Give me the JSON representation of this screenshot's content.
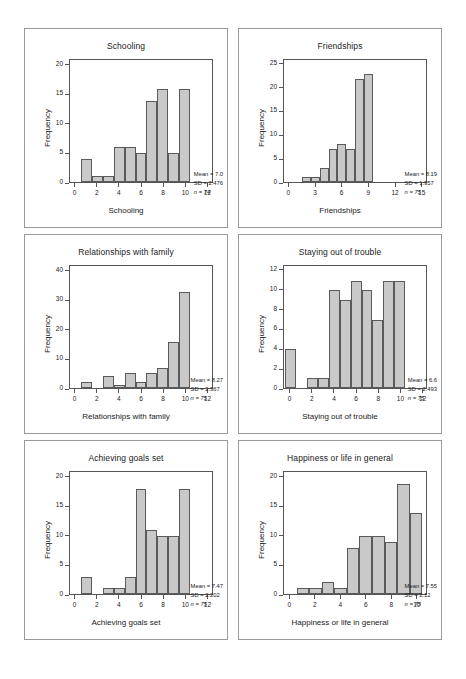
{
  "page": {
    "background": "#ffffff",
    "bar_fill": "#c9c9c9",
    "bar_stroke": "#5a5a5a",
    "axis_color": "#555555",
    "panel_border": "#9a9a9a"
  },
  "charts": [
    {
      "id": "schooling",
      "chart_data": {
        "type": "bar",
        "title": "Schooling",
        "xlabel": "Schooling",
        "ylabel": "Frequency",
        "categories": [
          1,
          2,
          3,
          4,
          5,
          6,
          7,
          8,
          9,
          10
        ],
        "values": [
          4,
          1,
          1,
          6,
          6,
          5,
          14,
          16,
          5,
          16
        ],
        "xticks": [
          0,
          2,
          4,
          6,
          8,
          10,
          12
        ],
        "yticks": [
          0,
          5,
          10,
          15,
          20
        ],
        "xlim": [
          -0.5,
          12.5
        ],
        "ylim": [
          0,
          21
        ],
        "grid": false,
        "legend": "none"
      },
      "stats": {
        "mean": "Mean = 7.0",
        "sd": "SD = 2.476",
        "n": "n = 74"
      }
    },
    {
      "id": "friendships",
      "chart_data": {
        "type": "bar",
        "title": "Friendships",
        "xlabel": "Friendships",
        "ylabel": "Frequency",
        "categories": [
          2,
          3,
          4,
          5,
          6,
          7,
          8,
          9,
          10
        ],
        "values": [
          1,
          1,
          3,
          7,
          8,
          7,
          22,
          23,
          0
        ],
        "xticks": [
          0,
          3,
          6,
          9,
          12,
          15
        ],
        "yticks": [
          0,
          5,
          10,
          15,
          20,
          25
        ],
        "xlim": [
          -0.6,
          15.6
        ],
        "ylim": [
          0,
          26
        ],
        "grid": false,
        "legend": "none"
      },
      "stats": {
        "mean": "Mean = 8.19",
        "sd": "SD = 1.957",
        "n": "n = 75"
      }
    },
    {
      "id": "relationships-with-family",
      "chart_data": {
        "type": "bar",
        "title": "Relationships with family",
        "xlabel": "Relationships with family",
        "ylabel": "Frequency",
        "categories": [
          1,
          2,
          3,
          4,
          5,
          6,
          7,
          8,
          9,
          10
        ],
        "values": [
          2,
          0,
          4,
          1,
          5,
          2,
          5,
          7,
          16,
          33
        ],
        "xticks": [
          0,
          2,
          4,
          6,
          8,
          10,
          12
        ],
        "yticks": [
          0,
          10,
          20,
          30,
          40
        ],
        "xlim": [
          -0.5,
          12.5
        ],
        "ylim": [
          0,
          42
        ],
        "grid": false,
        "legend": "none"
      },
      "stats": {
        "mean": "Mean = 8.27",
        "sd": "SD = 2.367",
        "n": "n = 75"
      }
    },
    {
      "id": "staying-out-of-trouble",
      "chart_data": {
        "type": "bar",
        "title": "Staying out of trouble",
        "xlabel": "Staying out of trouble",
        "ylabel": "Frequency",
        "categories": [
          0,
          1,
          2,
          3,
          4,
          5,
          6,
          7,
          8,
          9,
          10
        ],
        "values": [
          4,
          0,
          1,
          1,
          10,
          9,
          11,
          10,
          7,
          11,
          11
        ],
        "xticks": [
          0,
          2,
          4,
          6,
          8,
          10,
          12
        ],
        "yticks": [
          0,
          2,
          4,
          6,
          8,
          10,
          12
        ],
        "xlim": [
          -0.6,
          12.4
        ],
        "ylim": [
          0,
          12.5
        ],
        "grid": false,
        "legend": "none"
      },
      "stats": {
        "mean": "Mean = 6.6",
        "sd": "SD = 2.493",
        "n": "n = 75"
      }
    },
    {
      "id": "achieving-goals-set",
      "chart_data": {
        "type": "bar",
        "title": "Achieving goals set",
        "xlabel": "Achieving goals set",
        "ylabel": "Frequency",
        "categories": [
          1,
          2,
          3,
          4,
          5,
          6,
          7,
          8,
          9,
          10
        ],
        "values": [
          3,
          0,
          1,
          1,
          3,
          18,
          11,
          10,
          10,
          18
        ],
        "xticks": [
          0,
          2,
          4,
          6,
          8,
          10,
          12
        ],
        "yticks": [
          0,
          5,
          10,
          15,
          20
        ],
        "xlim": [
          -0.5,
          12.5
        ],
        "ylim": [
          0,
          21
        ],
        "grid": false,
        "legend": "none"
      },
      "stats": {
        "mean": "Mean = 7.47",
        "sd": "SD = 2.202",
        "n": "n = 75"
      }
    },
    {
      "id": "happiness-or-life-in-general",
      "chart_data": {
        "type": "bar",
        "title": "Happiness or life in general",
        "xlabel": "Happiness or life in general",
        "ylabel": "Frequency",
        "categories": [
          1,
          2,
          3,
          4,
          5,
          6,
          7,
          8,
          9,
          10
        ],
        "values": [
          1,
          1,
          2,
          1,
          8,
          10,
          10,
          9,
          19,
          14
        ],
        "xticks": [
          0,
          2,
          4,
          6,
          8,
          10
        ],
        "yticks": [
          0,
          5,
          10,
          15,
          20
        ],
        "xlim": [
          -0.5,
          10.8
        ],
        "ylim": [
          0,
          21
        ],
        "grid": false,
        "legend": "none"
      },
      "stats": {
        "mean": "Mean = 7.55",
        "sd": "SD = 2.12",
        "n": "n = 75"
      }
    }
  ]
}
